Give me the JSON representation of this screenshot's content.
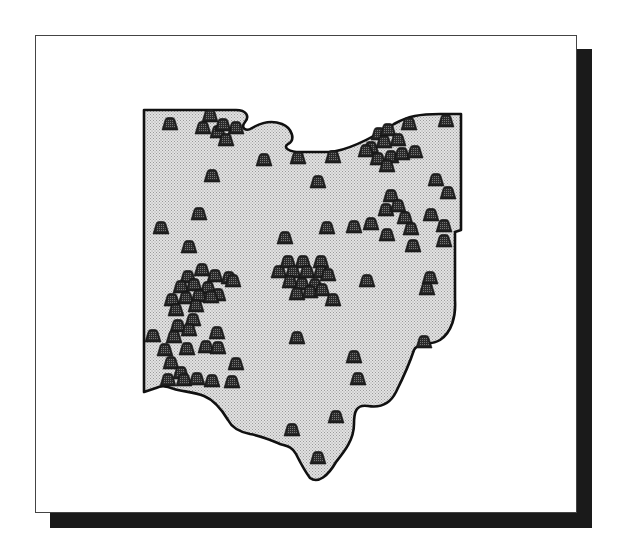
{
  "figure": {
    "kind": "state outline map with site symbols",
    "region": "Ohio",
    "symbol": "mound-icon",
    "colors": {
      "frame_border": "#444444",
      "shadow": "#1a1a1a",
      "state_fill": "#d4d4d4",
      "state_outline": "#111111",
      "mound_fill": "#222222",
      "mound_stipple": "#6a6a6a"
    },
    "mound_count": 108
  },
  "map": {
    "outline_path": "M144,110 L236,110 C246,110 250,116 245,122 C240,128 246,132 252,128 C262,122 272,120 282,124 C292,128 296,140 288,144 C282,148 290,152 300,152 L330,152 C350,150 372,138 394,124 C408,116 420,114 440,114 L461,114 L461,230 L455,232 L455,300 C456,316 452,332 440,340 C430,346 418,342 414,350 C410,362 404,376 396,392 C390,404 380,408 368,406 C356,404 354,412 354,424 C354,440 344,452 336,462 C328,476 318,484 310,478 C304,470 300,462 296,454 C292,446 286,446 280,444 C270,440 262,436 250,434 C240,432 232,428 228,420 C222,410 214,400 204,396 C194,392 186,392 178,390 C170,388 164,384 156,388 L144,392 Z",
    "mounds": [
      [
        170,
        124
      ],
      [
        210,
        116
      ],
      [
        203,
        128
      ],
      [
        218,
        132
      ],
      [
        226,
        140
      ],
      [
        236,
        128
      ],
      [
        223,
        125
      ],
      [
        264,
        160
      ],
      [
        298,
        158
      ],
      [
        333,
        157
      ],
      [
        212,
        176
      ],
      [
        318,
        182
      ],
      [
        199,
        214
      ],
      [
        161,
        228
      ],
      [
        189,
        247
      ],
      [
        285,
        238
      ],
      [
        327,
        228
      ],
      [
        409,
        124
      ],
      [
        446,
        121
      ],
      [
        379,
        134
      ],
      [
        371,
        148
      ],
      [
        388,
        130
      ],
      [
        398,
        140
      ],
      [
        384,
        142
      ],
      [
        366,
        151
      ],
      [
        378,
        159
      ],
      [
        391,
        157
      ],
      [
        402,
        154
      ],
      [
        387,
        166
      ],
      [
        415,
        152
      ],
      [
        436,
        180
      ],
      [
        448,
        193
      ],
      [
        391,
        196
      ],
      [
        371,
        224
      ],
      [
        354,
        227
      ],
      [
        386,
        210
      ],
      [
        398,
        206
      ],
      [
        405,
        218
      ],
      [
        387,
        235
      ],
      [
        411,
        229
      ],
      [
        431,
        215
      ],
      [
        413,
        246
      ],
      [
        444,
        226
      ],
      [
        444,
        241
      ],
      [
        188,
        277
      ],
      [
        202,
        270
      ],
      [
        215,
        276
      ],
      [
        229,
        278
      ],
      [
        233,
        281
      ],
      [
        181,
        287
      ],
      [
        194,
        285
      ],
      [
        208,
        288
      ],
      [
        218,
        295
      ],
      [
        172,
        300
      ],
      [
        186,
        298
      ],
      [
        199,
        296
      ],
      [
        211,
        297
      ],
      [
        176,
        310
      ],
      [
        196,
        306
      ],
      [
        193,
        320
      ],
      [
        178,
        326
      ],
      [
        189,
        330
      ],
      [
        174,
        337
      ],
      [
        153,
        336
      ],
      [
        165,
        350
      ],
      [
        187,
        349
      ],
      [
        206,
        347
      ],
      [
        217,
        333
      ],
      [
        218,
        348
      ],
      [
        171,
        363
      ],
      [
        181,
        373
      ],
      [
        168,
        380
      ],
      [
        184,
        380
      ],
      [
        197,
        379
      ],
      [
        212,
        381
      ],
      [
        232,
        382
      ],
      [
        236,
        364
      ],
      [
        279,
        272
      ],
      [
        288,
        262
      ],
      [
        303,
        262
      ],
      [
        321,
        262
      ],
      [
        293,
        272
      ],
      [
        307,
        272
      ],
      [
        321,
        272
      ],
      [
        328,
        275
      ],
      [
        290,
        282
      ],
      [
        302,
        284
      ],
      [
        315,
        285
      ],
      [
        297,
        294
      ],
      [
        310,
        292
      ],
      [
        322,
        290
      ],
      [
        333,
        300
      ],
      [
        367,
        281
      ],
      [
        430,
        278
      ],
      [
        427,
        289
      ],
      [
        297,
        338
      ],
      [
        354,
        357
      ],
      [
        358,
        379
      ],
      [
        424,
        342
      ],
      [
        292,
        430
      ],
      [
        336,
        417
      ],
      [
        318,
        458
      ]
    ]
  }
}
